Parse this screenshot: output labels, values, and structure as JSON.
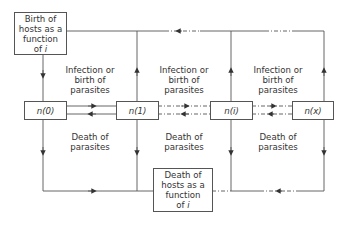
{
  "boxes": {
    "birth_hosts": {
      "line1": "Birth of",
      "line2": "hosts as a",
      "line3": "function",
      "line4_prefix": "of ",
      "line4_var": "i"
    },
    "death_hosts": {
      "line1": "Death of",
      "line2": "hosts as a",
      "line3": "function",
      "line4_prefix": "of ",
      "line4_var": "i"
    }
  },
  "states": [
    "n(0)",
    "n(1)",
    "n(i)",
    "n(x)"
  ],
  "labels": {
    "infection": [
      "Infection or",
      "birth of",
      "parasites"
    ],
    "death": [
      "Death of",
      "parasites"
    ]
  },
  "colors": {
    "line": "#555555",
    "text": "#333333"
  }
}
